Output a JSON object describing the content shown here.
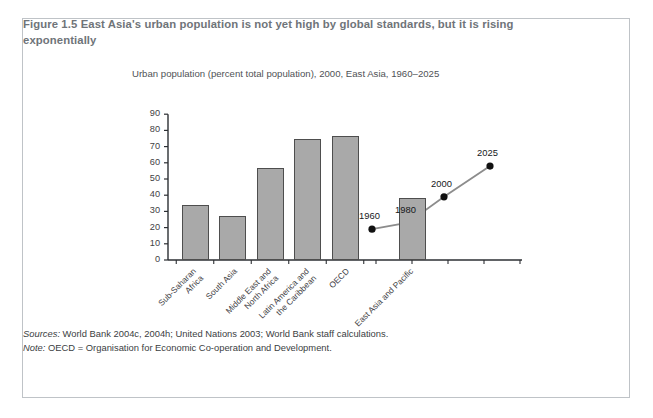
{
  "figure": {
    "label": "Figure 1.5",
    "caption": "East Asia's urban population is not yet high by global standards, but it is rising exponentially"
  },
  "footnotes": {
    "sources_label": "Sources:",
    "sources_text": "World Bank 2004c, 2004h; United Nations 2003; World Bank staff calculations.",
    "note_label": "Note:",
    "note_text": "OECD = Organisation for Economic Co-operation and Development."
  },
  "colors": {
    "bar_fill": "#a9a9a9",
    "bar_stroke": "#4e4e4e",
    "axis": "#2c2f33",
    "frame_border": "#bfc3c7",
    "caption_text": "#6f7479",
    "line_series": "#8c8c8c",
    "marker": "#111111"
  },
  "chart_data": {
    "type": "bar",
    "title": "Urban population (percent total population), 2000, East Asia, 1960–2025",
    "xlabel": "",
    "ylabel": "",
    "ylim": [
      0,
      90
    ],
    "yticks": [
      0,
      10,
      20,
      30,
      40,
      50,
      60,
      70,
      80,
      90
    ],
    "grid": false,
    "legend": "none",
    "categories": [
      "Sub-Saharan Africa",
      "South Asia",
      "Middle East and North Africa",
      "Latin America and the Caribbean",
      "OECD",
      "East Asia and Pacific"
    ],
    "values": [
      34,
      27,
      56.5,
      75,
      76.5,
      38
    ],
    "series": [
      {
        "name": "Urban population (percent total population), 2000",
        "type": "bar",
        "values": [
          34,
          27,
          56.5,
          75,
          76.5,
          38
        ]
      },
      {
        "name": "East Asia urban population trend",
        "type": "line",
        "x": [
          "1960",
          "1980",
          "2000",
          "2025"
        ],
        "values": [
          19,
          23,
          39,
          58
        ],
        "point_labels": [
          "1960",
          "1980",
          "2000",
          "2025"
        ]
      }
    ]
  }
}
